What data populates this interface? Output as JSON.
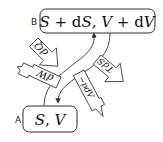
{
  "diagram": {
    "states": [
      {
        "id": "B",
        "label": "B",
        "expr_parts": [
          "S",
          " + ",
          "d",
          "S",
          ", ",
          "V",
          " + ",
          "d",
          "V"
        ],
        "expr": "S + dS, V + dV"
      },
      {
        "id": "A",
        "label": "A",
        "expr_parts": [
          "S",
          ", ",
          "V"
        ],
        "expr": "S, V"
      }
    ],
    "transitions": [
      {
        "from": "A",
        "to": "B",
        "kind": "curved-arrow"
      },
      {
        "from": "B",
        "to": "A",
        "kind": "curved-arrow"
      }
    ],
    "flows": [
      {
        "id": "heat-in",
        "label": "dQ",
        "style": "block-arrow",
        "direction": "in"
      },
      {
        "id": "work-in",
        "label": "dW",
        "style": "narrow-arrow",
        "direction": "out"
      },
      {
        "id": "entropy-term",
        "label": "TdS",
        "style": "block-arrow",
        "direction": "out"
      },
      {
        "id": "volume-term",
        "label": "−pdV",
        "style": "narrow-arrow",
        "direction": "out"
      }
    ],
    "colors": {
      "stroke": "#333333",
      "background": "#ffffff"
    }
  }
}
